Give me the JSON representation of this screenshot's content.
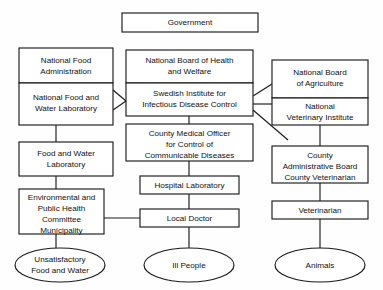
{
  "diagram": {
    "colors": {
      "background": "#fefefe",
      "stroke": "#1a1a1a",
      "fill": "#ffffff",
      "text": "#111111"
    },
    "nodes": {
      "government": {
        "label": "Government",
        "lines": [
          "Government"
        ],
        "shape": "box"
      },
      "national_food_administration": {
        "label": "National Food Administration",
        "lines": [
          "National Food",
          "Administration"
        ],
        "shape": "box"
      },
      "national_food_and_water_laboratory": {
        "label": "National Food and Water Laboratory",
        "lines": [
          "National Food and",
          "Water Laboratory"
        ],
        "shape": "box"
      },
      "food_and_water_laboratory": {
        "label": "Food and Water Laboratory",
        "lines": [
          "Food and Water",
          "Laboratory"
        ],
        "shape": "box"
      },
      "environmental_and_public_health_committee_municipality": {
        "label": "Environmental and Public Health Committee Municipality",
        "lines": [
          "Environmental and",
          "Public Health",
          "Committee",
          "Municipality"
        ],
        "shape": "box"
      },
      "unsatisfactory_food_and_water": {
        "label": "Unsatisfactory Food and Water",
        "lines": [
          "Unsatisfactory",
          "Food and Water"
        ],
        "shape": "ellipse"
      },
      "national_board_of_health_and_welfare": {
        "label": "National Board of Health and Welfare",
        "lines": [
          "National Board of Health",
          "and Welfare"
        ],
        "shape": "box"
      },
      "swedish_institute_for_infectious_disease_control": {
        "label": "Swedish Institute for Infectious Disease Control",
        "lines": [
          "Swedish Institute for",
          "Infectious Disease Control"
        ],
        "shape": "box"
      },
      "county_medical_officer": {
        "label": "County Medical Officer for Control of Communicable Diseases",
        "lines": [
          "County Medical Officer",
          "for Control of",
          "Communicable Diseases"
        ],
        "shape": "box"
      },
      "hospital_laboratory": {
        "label": "Hospital Laboratory",
        "lines": [
          "Hospital Laboratory"
        ],
        "shape": "box"
      },
      "local_doctor": {
        "label": "Local Doctor",
        "lines": [
          "Local Doctor"
        ],
        "shape": "box"
      },
      "ill_people": {
        "label": "Ill People",
        "lines": [
          "Ill People"
        ],
        "shape": "ellipse"
      },
      "national_board_of_agriculture": {
        "label": "National Board of Agriculture",
        "lines": [
          "National Board",
          "of Agriculture"
        ],
        "shape": "box"
      },
      "national_veterinary_institute": {
        "label": "National Veterinary Institute",
        "lines": [
          "National",
          "Veterinary Institute"
        ],
        "shape": "box"
      },
      "county_administrative_board": {
        "label": "County Administrative Board County Veterinarian",
        "lines": [
          "County",
          "Administrative Board",
          "County Veterinarian"
        ],
        "shape": "box"
      },
      "veterinarian": {
        "label": "Veterinarian",
        "lines": [
          "Veterinarian"
        ],
        "shape": "box"
      },
      "animals": {
        "label": "Animals",
        "lines": [
          "Animals"
        ],
        "shape": "ellipse"
      }
    },
    "edges": [
      {
        "from": "national_food_administration",
        "to": "swedish_institute_for_infectious_disease_control",
        "style": "diagonal"
      },
      {
        "from": "national_food_and_water_laboratory",
        "to": "swedish_institute_for_infectious_disease_control",
        "style": "diagonal"
      },
      {
        "from": "national_food_and_water_laboratory",
        "to": "food_and_water_laboratory",
        "style": "vertical"
      },
      {
        "from": "food_and_water_laboratory",
        "to": "environmental_and_public_health_committee_municipality",
        "style": "vertical"
      },
      {
        "from": "environmental_and_public_health_committee_municipality",
        "to": "unsatisfactory_food_and_water",
        "style": "vertical"
      },
      {
        "from": "environmental_and_public_health_committee_municipality",
        "to": "local_doctor",
        "style": "horizontal"
      },
      {
        "from": "swedish_institute_for_infectious_disease_control",
        "to": "county_medical_officer",
        "style": "vertical"
      },
      {
        "from": "county_medical_officer",
        "to": "hospital_laboratory",
        "style": "vertical"
      },
      {
        "from": "hospital_laboratory",
        "to": "local_doctor",
        "style": "vertical"
      },
      {
        "from": "local_doctor",
        "to": "ill_people",
        "style": "vertical"
      },
      {
        "from": "swedish_institute_for_infectious_disease_control",
        "to": "national_board_of_agriculture",
        "style": "diagonal"
      },
      {
        "from": "swedish_institute_for_infectious_disease_control",
        "to": "national_veterinary_institute",
        "style": "horizontal"
      },
      {
        "from": "swedish_institute_for_infectious_disease_control",
        "to": "county_administrative_board",
        "style": "diagonal"
      },
      {
        "from": "national_veterinary_institute",
        "to": "county_administrative_board",
        "style": "vertical"
      },
      {
        "from": "county_administrative_board",
        "to": "veterinarian",
        "style": "vertical"
      },
      {
        "from": "veterinarian",
        "to": "animals",
        "style": "vertical"
      }
    ]
  }
}
